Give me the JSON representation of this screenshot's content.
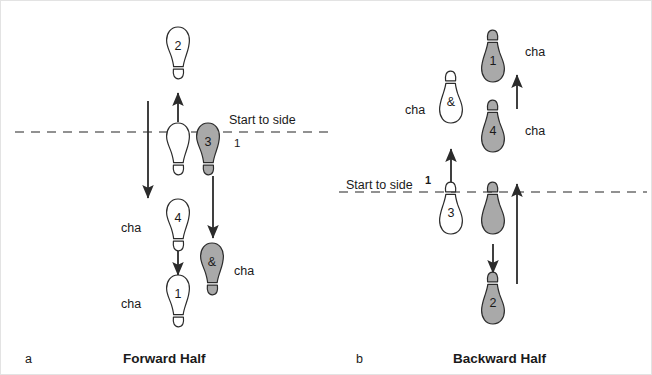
{
  "figure": {
    "panels": [
      {
        "key": "forward",
        "letter": "a",
        "caption": "Forward Half",
        "start_label": "Start to side",
        "start_beat": "1"
      },
      {
        "key": "backward",
        "letter": "b",
        "caption": "Backward Half",
        "start_label": "Start to side",
        "start_beat": "1"
      }
    ],
    "colors": {
      "shaded_foot_fill": "#a9a9a9",
      "open_foot_fill": "#ffffff",
      "outline": "#2b2b2b",
      "arrow": "#2b2b2b",
      "dashed_line": "#6e6e6e",
      "text": "#1a1a1a",
      "frame": "#e3e3e3"
    },
    "legend_note": {
      "shaded": "shaded footprint",
      "open": "open footprint"
    }
  },
  "forward_half": {
    "footprints": [
      {
        "id": "f-2",
        "label": "2",
        "shaded": false,
        "x": 177,
        "y": 52,
        "rot": 0,
        "heel": "down"
      },
      {
        "id": "f-open",
        "label": "",
        "shaded": false,
        "x": 177,
        "y": 148,
        "rot": 0,
        "heel": "down"
      },
      {
        "id": "f-3",
        "label": "3",
        "shaded": true,
        "x": 207,
        "y": 148,
        "rot": 0,
        "heel": "down"
      },
      {
        "id": "f-4",
        "label": "4",
        "shaded": false,
        "x": 177,
        "y": 224,
        "rot": 0,
        "heel": "down"
      },
      {
        "id": "f-amp",
        "label": "&",
        "shaded": true,
        "x": 211,
        "y": 268,
        "rot": 0,
        "heel": "down"
      },
      {
        "id": "f-1",
        "label": "1",
        "shaded": false,
        "x": 177,
        "y": 300,
        "rot": 0,
        "heel": "down"
      }
    ],
    "cha_labels": [
      {
        "id": "cha-left-4",
        "text": "cha",
        "x": 120,
        "y": 221
      },
      {
        "id": "cha-amp",
        "text": "cha",
        "x": 233,
        "y": 264
      },
      {
        "id": "cha-left-1",
        "text": "cha",
        "x": 120,
        "y": 297
      }
    ],
    "arrows": [
      {
        "id": "long-down",
        "x1": 147,
        "y1": 100,
        "x2": 147,
        "y2": 197,
        "head": "end"
      },
      {
        "id": "up-to-2",
        "x1": 177,
        "y1": 121,
        "x2": 177,
        "y2": 92,
        "head": "end"
      },
      {
        "id": "down-to-amp",
        "x1": 212,
        "y1": 175,
        "x2": 212,
        "y2": 237,
        "head": "end"
      },
      {
        "id": "down-to-1",
        "x1": 177,
        "y1": 250,
        "x2": 177,
        "y2": 274,
        "head": "end"
      }
    ],
    "dashed_line": {
      "y": 131,
      "x1": 14,
      "x2": 332
    }
  },
  "backward_half": {
    "footprints": [
      {
        "id": "b-1",
        "label": "1",
        "shaded": true,
        "x": 492,
        "y": 55,
        "rot": 180,
        "heel": "up"
      },
      {
        "id": "b-amp",
        "label": "&",
        "shaded": false,
        "x": 450,
        "y": 96,
        "rot": 180,
        "heel": "up"
      },
      {
        "id": "b-4",
        "label": "4",
        "shaded": true,
        "x": 492,
        "y": 125,
        "rot": 180,
        "heel": "up"
      },
      {
        "id": "b-3",
        "label": "3",
        "shaded": false,
        "x": 450,
        "y": 207,
        "rot": 180,
        "heel": "up"
      },
      {
        "id": "b-open",
        "label": "",
        "shaded": true,
        "x": 492,
        "y": 207,
        "rot": 180,
        "heel": "up"
      },
      {
        "id": "b-2",
        "label": "2",
        "shaded": true,
        "x": 492,
        "y": 297,
        "rot": 180,
        "heel": "up"
      }
    ],
    "cha_labels": [
      {
        "id": "cha-b-1",
        "text": "cha",
        "x": 524,
        "y": 45
      },
      {
        "id": "cha-b-amp",
        "text": "cha",
        "x": 404,
        "y": 103
      },
      {
        "id": "cha-b-4",
        "text": "cha",
        "x": 524,
        "y": 124
      }
    ],
    "arrows": [
      {
        "id": "up-b-top",
        "x1": 516,
        "y1": 108,
        "x2": 516,
        "y2": 74,
        "head": "end"
      },
      {
        "id": "up-b-long",
        "x1": 516,
        "y1": 283,
        "x2": 516,
        "y2": 183,
        "head": "end"
      },
      {
        "id": "up-to-amp",
        "x1": 450,
        "y1": 182,
        "x2": 450,
        "y2": 148,
        "head": "end"
      },
      {
        "id": "down-to-2",
        "x1": 492,
        "y1": 243,
        "x2": 492,
        "y2": 272,
        "head": "end"
      }
    ],
    "dashed_line": {
      "y": 191,
      "x1": 338,
      "x2": 646
    }
  },
  "captions": {
    "a_letter": "a",
    "a_text": "Forward Half",
    "b_letter": "b",
    "b_text": "Backward Half",
    "a_letter_x": 24,
    "a_letter_y": 352,
    "a_text_x": 122,
    "a_text_y": 351,
    "b_letter_x": 355,
    "b_letter_y": 352,
    "b_text_x": 452,
    "b_text_y": 351
  },
  "start_markers": {
    "forward": {
      "label": "Start to side",
      "beat": "1",
      "label_x": 228,
      "label_y": 113,
      "beat_x": 233,
      "beat_y": 137
    },
    "backward": {
      "label": "Start to side",
      "beat": "1",
      "label_x": 345,
      "label_y": 178,
      "beat_x": 424,
      "beat_y": 174
    }
  }
}
